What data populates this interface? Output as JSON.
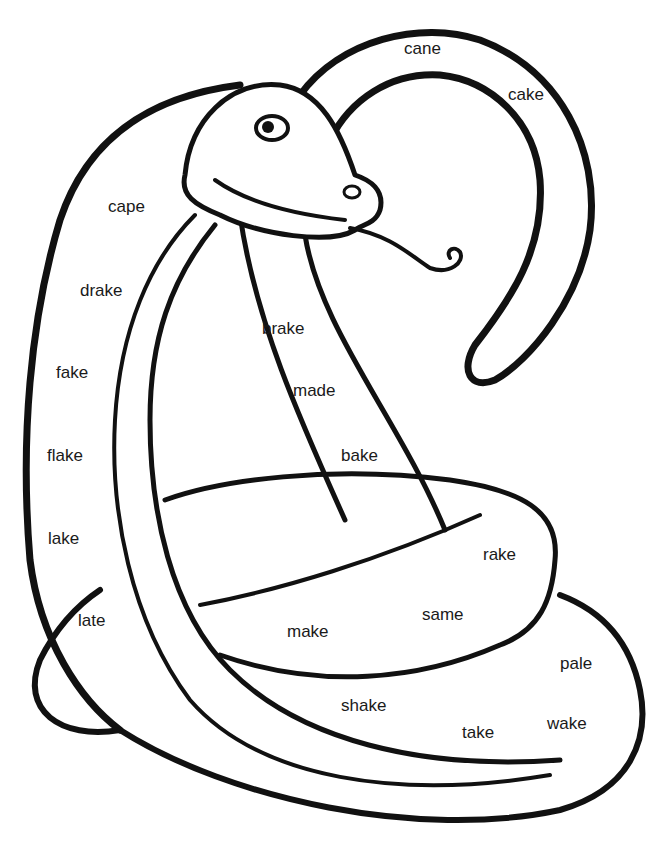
{
  "page": {
    "ink_color": "#111111",
    "paper_color": "#ffffff"
  },
  "words": [
    {
      "id": "cane",
      "text": "cane"
    },
    {
      "id": "cake",
      "text": "cake"
    },
    {
      "id": "cape",
      "text": "cape"
    },
    {
      "id": "drake",
      "text": "drake"
    },
    {
      "id": "brake",
      "text": "brake"
    },
    {
      "id": "fake",
      "text": "fake"
    },
    {
      "id": "made",
      "text": "made"
    },
    {
      "id": "flake",
      "text": "flake"
    },
    {
      "id": "bake",
      "text": "bake"
    },
    {
      "id": "lake",
      "text": "lake"
    },
    {
      "id": "rake",
      "text": "rake"
    },
    {
      "id": "late",
      "text": "late"
    },
    {
      "id": "same",
      "text": "same"
    },
    {
      "id": "make",
      "text": "make"
    },
    {
      "id": "pale",
      "text": "pale"
    },
    {
      "id": "shake",
      "text": "shake"
    },
    {
      "id": "wake",
      "text": "wake"
    },
    {
      "id": "take",
      "text": "take"
    }
  ]
}
